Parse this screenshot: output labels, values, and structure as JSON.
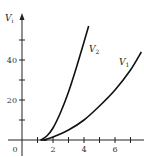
{
  "chart_data": {
    "type": "line",
    "title": "",
    "xlabel": "",
    "ylabel": "V",
    "ylabel_subscript": "i",
    "xlim": [
      -1,
      7.8
    ],
    "ylim": [
      -6,
      62
    ],
    "x_ticks": [
      2,
      4,
      6
    ],
    "x_minor_ticks": [
      1,
      3,
      5,
      7
    ],
    "y_ticks": [
      20,
      40
    ],
    "y_minor_ticks": [
      10,
      30,
      50
    ],
    "origin_label": "0",
    "grid": false,
    "legend": "inline labels",
    "series": [
      {
        "name": "V2",
        "label_main": "V",
        "label_sub": "2",
        "x": [
          1.2,
          1.6,
          2.0,
          2.5,
          3.0,
          3.5,
          4.0,
          4.3
        ],
        "y": [
          0,
          2,
          6,
          14,
          24,
          36,
          49,
          57
        ]
      },
      {
        "name": "V1",
        "label_main": "V",
        "label_sub": "1",
        "x": [
          1.4,
          2.0,
          3.0,
          4.0,
          5.0,
          6.0,
          7.0,
          7.7
        ],
        "y": [
          0,
          1.5,
          5,
          10,
          17,
          25,
          35,
          44
        ]
      }
    ]
  }
}
